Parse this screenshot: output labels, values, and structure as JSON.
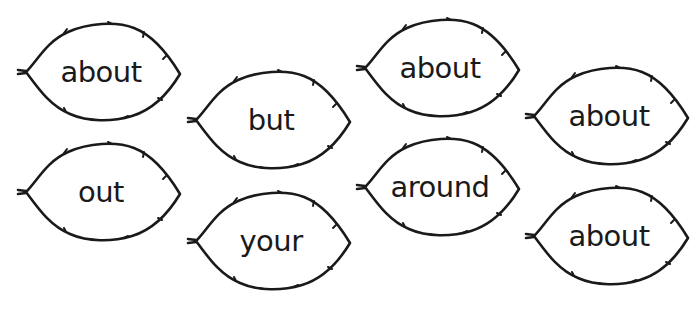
{
  "worksheet": {
    "stroke_color": "#1a1a1a",
    "background": "#ffffff",
    "leaves": [
      {
        "word": "about",
        "x": 16,
        "y": 20
      },
      {
        "word": "but",
        "x": 186,
        "y": 68
      },
      {
        "word": "about",
        "x": 355,
        "y": 16
      },
      {
        "word": "about",
        "x": 524,
        "y": 64
      },
      {
        "word": "out",
        "x": 16,
        "y": 140
      },
      {
        "word": "your",
        "x": 186,
        "y": 189
      },
      {
        "word": "around",
        "x": 355,
        "y": 135
      },
      {
        "word": "about",
        "x": 524,
        "y": 184
      }
    ]
  }
}
